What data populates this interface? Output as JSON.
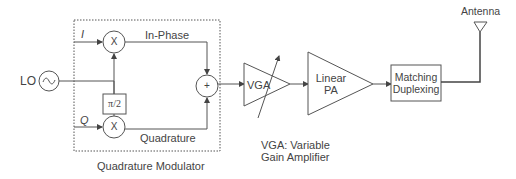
{
  "diagram": {
    "type": "block-diagram",
    "inputs": {
      "i_label": "I",
      "q_label": "Q",
      "lo_label": "LO"
    },
    "modulator": {
      "caption": "Quadrature Modulator",
      "mixer_symbol": "X",
      "phase_shift_label": "π/2",
      "sum_symbol": "+",
      "in_phase_label": "In-Phase",
      "quadrature_label": "Quadrature",
      "oscillator_symbol": "~"
    },
    "vga": {
      "label": "VGA",
      "note_line1": "VGA: Variable",
      "note_line2": "Gain Amplifier"
    },
    "pa": {
      "line1": "Linear",
      "line2": "PA"
    },
    "matching": {
      "line1": "Matching",
      "line2": "Duplexing"
    },
    "antenna": {
      "label": "Antenna"
    },
    "colors": {
      "stroke": "#555555",
      "text": "#444444",
      "background": "#ffffff"
    }
  }
}
